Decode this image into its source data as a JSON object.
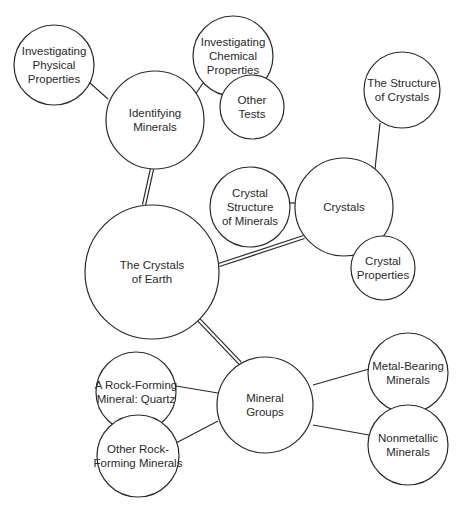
{
  "diagram": {
    "type": "concept-map",
    "root": "crystals-of-earth",
    "nodes": [
      {
        "id": "crystals-of-earth",
        "lines": [
          "The Crystals",
          "of Earth"
        ],
        "cx": 152,
        "cy": 272,
        "r": 67
      },
      {
        "id": "identifying-minerals",
        "lines": [
          "Identifying",
          "Minerals"
        ],
        "cx": 155,
        "cy": 120,
        "r": 49
      },
      {
        "id": "investigating-physical-properties",
        "lines": [
          "Investigating",
          "Physical",
          "Properties"
        ],
        "cx": 54,
        "cy": 65,
        "r": 40
      },
      {
        "id": "investigating-chemical-properties",
        "lines": [
          "Investigating",
          "Chemical",
          "Properties"
        ],
        "cx": 233,
        "cy": 56,
        "r": 40
      },
      {
        "id": "other-tests",
        "lines": [
          "Other",
          "Tests"
        ],
        "cx": 252,
        "cy": 107,
        "r": 32
      },
      {
        "id": "crystals",
        "lines": [
          "Crystals"
        ],
        "cx": 344,
        "cy": 207,
        "r": 49
      },
      {
        "id": "structure-of-crystals",
        "lines": [
          "The Structure",
          "of Crystals"
        ],
        "cx": 402,
        "cy": 90,
        "r": 38
      },
      {
        "id": "crystal-structure-of-minerals",
        "lines": [
          "Crystal",
          "Structure",
          "of Minerals"
        ],
        "cx": 250,
        "cy": 207,
        "r": 40
      },
      {
        "id": "crystal-properties",
        "lines": [
          "Crystal",
          "Properties"
        ],
        "cx": 383,
        "cy": 268,
        "r": 32
      },
      {
        "id": "mineral-groups",
        "lines": [
          "Mineral",
          "Groups"
        ],
        "cx": 265,
        "cy": 405,
        "r": 48
      },
      {
        "id": "rock-forming-quartz",
        "lines": [
          "A Rock-Forming",
          "Mineral: Quartz"
        ],
        "cx": 136,
        "cy": 392,
        "r": 40
      },
      {
        "id": "other-rock-forming",
        "lines": [
          "Other Rock-",
          "Forming Minerals"
        ],
        "cx": 138,
        "cy": 456,
        "r": 41
      },
      {
        "id": "metal-bearing",
        "lines": [
          "Metal-Bearing",
          "Minerals"
        ],
        "cx": 408,
        "cy": 373,
        "r": 40
      },
      {
        "id": "nonmetallic",
        "lines": [
          "Nonmetallic",
          "Minerals"
        ],
        "cx": 408,
        "cy": 445,
        "r": 40
      }
    ],
    "links": [
      {
        "from": "crystals-of-earth",
        "to": "identifying-minerals",
        "style": "double",
        "x1": 144,
        "y1": 205,
        "x2": 152,
        "y2": 169
      },
      {
        "from": "crystals-of-earth",
        "to": "crystals",
        "style": "double",
        "x1": 219,
        "y1": 265,
        "x2": 304,
        "y2": 237
      },
      {
        "from": "crystals-of-earth",
        "to": "mineral-groups",
        "style": "double",
        "x1": 199,
        "y1": 320,
        "x2": 240,
        "y2": 363
      },
      {
        "from": "identifying-minerals",
        "to": "investigating-physical-properties",
        "style": "single",
        "x1": 108,
        "y1": 99,
        "x2": 90,
        "y2": 83
      },
      {
        "from": "identifying-minerals",
        "to": "investigating-chemical-properties",
        "style": "single",
        "x1": 195,
        "y1": 95,
        "x2": 203,
        "y2": 83
      },
      {
        "from": "crystals",
        "to": "crystal-structure-of-minerals",
        "style": "single",
        "x1": 295,
        "y1": 203,
        "x2": 290,
        "y2": 203
      },
      {
        "from": "crystals",
        "to": "structure-of-crystals",
        "style": "single",
        "x1": 375,
        "y1": 169,
        "x2": 380,
        "y2": 123
      },
      {
        "from": "mineral-groups",
        "to": "rock-forming-quartz",
        "style": "single",
        "x1": 218,
        "y1": 393,
        "x2": 176,
        "y2": 386
      },
      {
        "from": "mineral-groups",
        "to": "other-rock-forming",
        "style": "single",
        "x1": 218,
        "y1": 421,
        "x2": 176,
        "y2": 443
      },
      {
        "from": "mineral-groups",
        "to": "metal-bearing",
        "style": "single",
        "x1": 313,
        "y1": 385,
        "x2": 369,
        "y2": 369
      },
      {
        "from": "mineral-groups",
        "to": "nonmetallic",
        "style": "single",
        "x1": 313,
        "y1": 425,
        "x2": 369,
        "y2": 435
      }
    ]
  }
}
